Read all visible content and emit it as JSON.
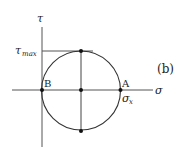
{
  "diagram": {
    "panel_label": "(b)",
    "axes": {
      "horizontal_label": "σ",
      "vertical_label": "τ"
    },
    "points": {
      "A": "A",
      "B": "B"
    },
    "annotations": {
      "tau_max_main": "τ",
      "tau_max_sub": "max",
      "sigma_x_main": "σ",
      "sigma_x_sub": "x"
    },
    "colors": {
      "line": "#333333",
      "axis": "#555555",
      "text": "#222222"
    }
  }
}
